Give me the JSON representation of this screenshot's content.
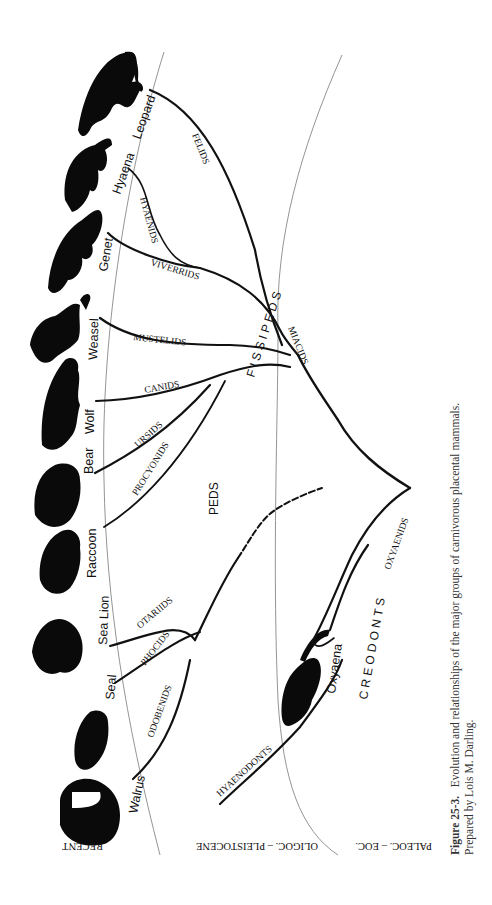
{
  "figure": {
    "number": "Figure 25-3.",
    "caption_text": "Evolution and relationships of the major groups of carnivorous placental mammals.",
    "credit": "Prepared by Lois M. Darling.",
    "orientation": "rotated 90° (landscape figure on portrait page)"
  },
  "time_periods": [
    {
      "label": "RECENT"
    },
    {
      "label": "OLIGOC. – PLEISTOCENE"
    },
    {
      "label": "PALEOC. – EOC."
    }
  ],
  "major_groups": {
    "fissipeds": "F I S S I P E D S",
    "pinnipeds_1": "PINNI",
    "pinnipeds_2": "PEDS",
    "creodonts": "C R E O D O N T S",
    "miacids": "MIACIDS"
  },
  "families": {
    "felids": "FELIDS",
    "hyaenids": "HYAENIDS",
    "viverrids": "VIVERRIDS",
    "mustelids": "MUSTELIDS",
    "canids": "CANIDS",
    "ursids": "URSIDS",
    "procyonids": "PROCYONIDS",
    "otariids": "OTARIIDS",
    "phocids": "PHOCIDS",
    "odobenids": "ODOBENIDS",
    "hyaenodonts": "HYAENODONTS",
    "oxyaenids": "OXYAENIDS"
  },
  "animals": {
    "leopard": "Leopard",
    "hyaena": "Hyaena",
    "genet": "Genet",
    "weasel": "Weasel",
    "wolf": "Wolf",
    "bear": "Bear",
    "raccoon": "Raccoon",
    "sea_lion": "Sea Lion",
    "seal": "Seal",
    "walrus": "Walrus",
    "oxyaena": "Oxyaena"
  }
}
